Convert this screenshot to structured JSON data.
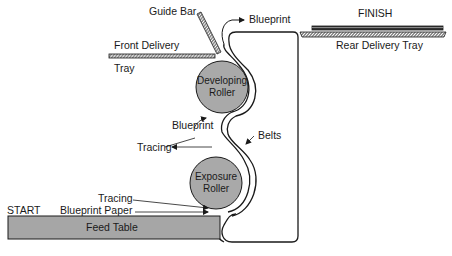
{
  "diagram": {
    "type": "process-schematic",
    "labels": {
      "guide_bar": "Guide Bar",
      "blueprint_top": "Blueprint",
      "finish": "FINISH",
      "rear_delivery_tray": "Rear Delivery Tray",
      "front_delivery": "Front Delivery",
      "tray": "Tray",
      "developing_roller_line1": "Developing",
      "developing_roller_line2": "Roller",
      "blueprint_mid": "Blueprint",
      "belts": "Belts",
      "tracing_out": "Tracing",
      "exposure_roller_line1": "Exposure",
      "exposure_roller_line2": "Roller",
      "start": "START",
      "tracing_in": "Tracing",
      "blueprint_paper": "Blueprint Paper",
      "feed_table": "Feed Table"
    },
    "colors": {
      "roller_fill": "#a9a9a9",
      "feed_table_fill": "#a6a6a6",
      "stroke": "#1a1a1a",
      "background": "#ffffff"
    }
  }
}
